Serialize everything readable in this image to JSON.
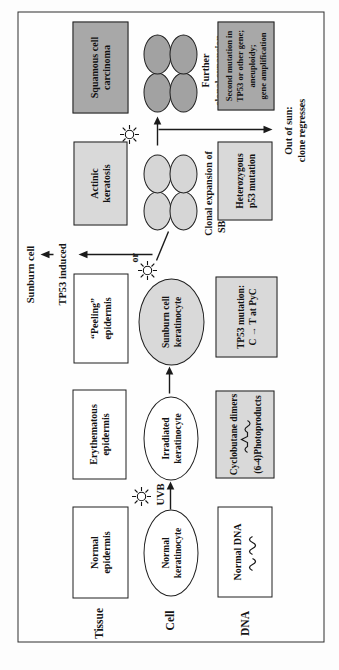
{
  "row_labels": {
    "tissue": "Tissue",
    "cell": "Cell",
    "dna": "DNA"
  },
  "tissue_row": {
    "normal_epidermis": {
      "line1": "Normal",
      "line2": "epidermis"
    },
    "erythematous_epidermis": {
      "line1": "Erythematous",
      "line2": "epidermis"
    },
    "peeling_epidermis": {
      "line1": "“Peeling”",
      "line2": "epidermis"
    },
    "actinic_keratosis": {
      "line1": "Actinic",
      "line2": "keratosis"
    },
    "squamous_cell_carcinoma": {
      "line1": "Squamous cell",
      "line2": "carcinoma"
    }
  },
  "cell_row": {
    "normal_keratinocyte": {
      "line1": "Normal",
      "line2": "keratinocyte"
    },
    "uvb_label": "UVB",
    "irradiated_keratinocyte": {
      "line1": "Irradiated",
      "line2": "keratinocyte"
    },
    "sunburn_keratinocyte": {
      "line1": "Sunburn cell",
      "line2": "keratinocyte"
    },
    "or_label": "or",
    "tp53_induced_label": "TP53 induced",
    "sunburn_cell_label": "Sunburn cell",
    "clonal_expansion_caption": {
      "line1": "Clonal expansion of",
      "line2": "SBC keratinocytes"
    },
    "further_expansion_caption": {
      "line1": "Further",
      "line2": "clonal expansion"
    },
    "out_of_sun_caption": {
      "line1": "Out of sun:",
      "line2": "clone regresses"
    }
  },
  "dna_row": {
    "normal_dna": {
      "line1": "Normal DNA"
    },
    "photoproducts": {
      "line1": "Cyclobutane dimers",
      "line2": "(6-4)Photoproducts"
    },
    "tp53_mutation": {
      "line1": "TP53 mutation:",
      "line2": "C → T at PyC"
    },
    "heterozygous_p53": {
      "line1": "Heterozygous",
      "line2": "p53 mutation"
    },
    "second_mutation": {
      "line1": "Second mutation in",
      "line2": "TP53 or other gene;",
      "line3": "aneuploidy;",
      "line4": "gene amplification"
    }
  },
  "icons": {
    "sun": "☼",
    "dna_wave": "∿∿",
    "dimer_wave": "∿^∿"
  },
  "colors": {
    "light_gray": "#d9d9d9",
    "dark_gray": "#a8a8a8",
    "line": "#1a1a1a",
    "background": "#ffffff"
  }
}
